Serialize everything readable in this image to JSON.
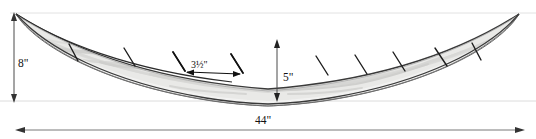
{
  "figure": {
    "name": "wooden-boat-hull-elevation-drawing",
    "background_color": "#ffffff"
  },
  "dimensions": {
    "height": {
      "label": "8\"",
      "value": 8,
      "unit": "inch",
      "orientation": "vertical",
      "position": "left"
    },
    "depth": {
      "label": "5\"",
      "value": 5,
      "unit": "inch",
      "orientation": "vertical",
      "position": "center"
    },
    "slat_spacing": {
      "label": "3½\"",
      "value": 3.5,
      "unit": "inch",
      "orientation": "horizontal",
      "position": "upper-left-of-center"
    },
    "length": {
      "label": "44\"",
      "value": 44,
      "unit": "inch",
      "orientation": "horizontal",
      "position": "bottom"
    }
  },
  "colors": {
    "outline": "#3a3a3a",
    "hull_fill": "#e9e9e7",
    "wood_grain": "#d2d2d0",
    "wood_grain_light": "#dedede",
    "dimension_line": "#4a4a4a",
    "guide_line": "#d8d8d8",
    "slat_mark": "#1d1d1d",
    "text": "#121212"
  },
  "hull": {
    "shape": "boat-crescent",
    "tip_left": {
      "x": 16,
      "y": 14
    },
    "tip_right": {
      "x": 519,
      "y": 14
    },
    "keel_bottom_y": 101,
    "rim_center_y": 40,
    "slat_count": 10
  },
  "slat_marks": [
    {
      "x1": 69,
      "y1": 44,
      "x2": 78,
      "y2": 61
    },
    {
      "x1": 124,
      "y1": 48,
      "x2": 135,
      "y2": 66
    },
    {
      "x1": 173,
      "y1": 52,
      "x2": 185,
      "y2": 71
    },
    {
      "x1": 231,
      "y1": 54,
      "x2": 243,
      "y2": 73
    },
    {
      "x1": 280,
      "y1": 55,
      "x2": 292,
      "y2": 74
    },
    {
      "x1": 316,
      "y1": 56,
      "x2": 328,
      "y2": 75
    },
    {
      "x1": 355,
      "y1": 55,
      "x2": 367,
      "y2": 74
    },
    {
      "x1": 393,
      "y1": 52,
      "x2": 405,
      "y2": 71
    },
    {
      "x1": 435,
      "y1": 48,
      "x2": 447,
      "y2": 66
    },
    {
      "x1": 472,
      "y1": 43,
      "x2": 481,
      "y2": 60
    }
  ],
  "guide_lines": {
    "top_guide_y": 13,
    "bottom_guide_y": 101
  }
}
